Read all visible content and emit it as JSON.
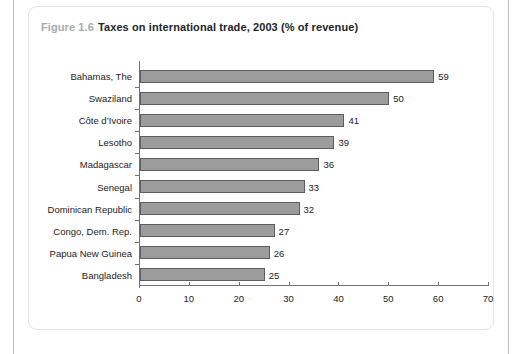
{
  "figure": {
    "number": "Figure 1.6",
    "title": "Taxes on international trade, 2003 (% of revenue)"
  },
  "chart_data": {
    "type": "bar",
    "orientation": "horizontal",
    "title": "Taxes on international trade, 2003 (% of revenue)",
    "categories": [
      "Bahamas, The",
      "Swaziland",
      "Côte d’Ivoire",
      "Lesotho",
      "Madagascar",
      "Senegal",
      "Dominican Republic",
      "Congo, Dem. Rep.",
      "Papua New Guinea",
      "Bangladesh"
    ],
    "values": [
      59,
      50,
      41,
      39,
      36,
      33,
      32,
      27,
      26,
      25
    ],
    "data_labels": [
      "59",
      "50",
      "41",
      "39",
      "36",
      "33",
      "32",
      "27",
      "26",
      "25"
    ],
    "xlabel": "",
    "ylabel": "",
    "xlim": [
      0,
      70
    ],
    "xticks": [
      0,
      10,
      20,
      30,
      40,
      50,
      60,
      70
    ],
    "xtick_labels": [
      "0",
      "10",
      "20",
      "30",
      "40",
      "50",
      "60",
      "70"
    ],
    "grid": false,
    "legend": false,
    "bar_color": "#9c9c9c",
    "bar_border_color": "#5b5d60",
    "axis_color": "#6f7276",
    "text_color": "#1f2124"
  }
}
